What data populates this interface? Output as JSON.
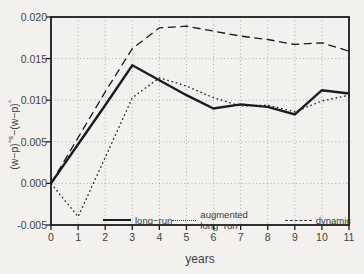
{
  "figure": {
    "y_axis": {
      "label_parts": {
        "base1": "(w−p)",
        "sup1": "^s",
        "base2": "−(w−p)",
        "sup2": "^"
      }
    },
    "x_axis": {
      "title": "years"
    },
    "legend": [
      {
        "label": "long−run",
        "style": "solid"
      },
      {
        "label": "augmented long−run",
        "style": "dotted"
      },
      {
        "label": "dynamic",
        "style": "dashed"
      }
    ],
    "ink_color": "#1b1b1b",
    "grid_color": "#9a9a96",
    "paper_color": "#f2f1ed"
  },
  "chart_data": {
    "type": "line",
    "title": "",
    "xlabel": "years",
    "ylabel": "(w−p)^s−(w−p)^",
    "xlim": [
      0,
      11
    ],
    "ylim": [
      -0.005,
      0.02
    ],
    "grid": true,
    "legend_position": "inside-bottom",
    "x": [
      0,
      1,
      2,
      3,
      4,
      5,
      6,
      7,
      8,
      9,
      10,
      11
    ],
    "x_tick_labels": [
      "0",
      "1",
      "2",
      "3",
      "4",
      "5",
      "6",
      "7",
      "8",
      "9",
      "10",
      "11"
    ],
    "y_ticks": [
      {
        "value": 0.02,
        "label": "0.020"
      },
      {
        "value": 0.015,
        "label": "0.015"
      },
      {
        "value": 0.01,
        "label": "0.010"
      },
      {
        "value": 0.005,
        "label": "0.005"
      },
      {
        "value": 0.0,
        "label": "0.000"
      },
      {
        "value": -0.005,
        "label": "-0.005"
      }
    ],
    "series": [
      {
        "name": "long−run",
        "line": "solid",
        "values": [
          0.0,
          0.0047,
          0.0094,
          0.0142,
          0.0124,
          0.0106,
          0.009,
          0.0095,
          0.0092,
          0.0083,
          0.0112,
          0.0108
        ]
      },
      {
        "name": "augmented long−run",
        "line": "dotted",
        "values": [
          0.0,
          -0.004,
          0.0031,
          0.0103,
          0.0127,
          0.0117,
          0.0103,
          0.0093,
          0.0094,
          0.0086,
          0.0099,
          0.0106
        ]
      },
      {
        "name": "dynamic",
        "line": "dashed",
        "values": [
          0.0,
          0.0055,
          0.011,
          0.0162,
          0.0187,
          0.0189,
          0.0183,
          0.0177,
          0.0173,
          0.0167,
          0.0169,
          0.0159
        ]
      }
    ]
  }
}
